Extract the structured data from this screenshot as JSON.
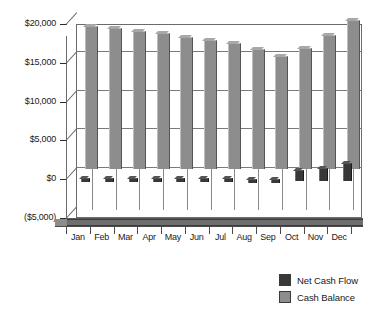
{
  "chart_data": {
    "type": "bar",
    "title": "",
    "xlabel": "",
    "ylabel": "",
    "grid": true,
    "legend_position": "bottom-right",
    "categories": [
      "Jan",
      "Feb",
      "Mar",
      "Apr",
      "May",
      "Jun",
      "Jul",
      "Aug",
      "Sep",
      "Oct",
      "Nov",
      "Dec"
    ],
    "ylim": [
      -5000,
      20000
    ],
    "ytick_labels": [
      "$20,000",
      "$15,000",
      "$10,000",
      "$5,000",
      "$0",
      "($5,000)"
    ],
    "ytick_values": [
      20000,
      15000,
      10000,
      5000,
      0,
      -5000
    ],
    "series": [
      {
        "name": "Net Cash Flow",
        "color": "#383838",
        "values": [
          150,
          120,
          110,
          110,
          100,
          100,
          100,
          90,
          80,
          1150,
          1500,
          2150
        ]
      },
      {
        "name": "Cash Balance",
        "color": "#8d8d8d",
        "values": [
          18200,
          17900,
          17550,
          17300,
          16800,
          16350,
          15950,
          15250,
          14350,
          15400,
          17050,
          18950
        ]
      }
    ]
  },
  "legend": {
    "items": [
      {
        "label": "Net Cash Flow",
        "color": "#383838"
      },
      {
        "label": "Cash Balance",
        "color": "#8d8d8d"
      }
    ]
  }
}
